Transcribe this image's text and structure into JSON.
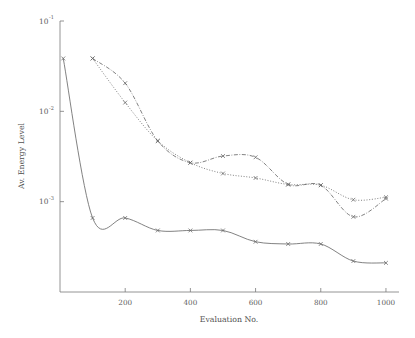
{
  "chart_data": {
    "type": "line",
    "title": "",
    "xlabel": "Evaluation No.",
    "ylabel": "Av. Energy Level",
    "yscale": "log",
    "xlim": [
      0,
      1040
    ],
    "ylim": [
      0.0001,
      0.1
    ],
    "grid": false,
    "legend": "none",
    "xticks": [
      200,
      400,
      600,
      800,
      1000
    ],
    "xtick_labels": [
      "200",
      "400",
      "600",
      "800",
      "1000"
    ],
    "yticks": [
      0.1,
      0.01,
      0.001
    ],
    "ytick_labels": [
      "10^-1",
      "10^-2",
      "10^-3"
    ],
    "ytick_bases": [
      "10",
      "10",
      "10"
    ],
    "ytick_exponents": [
      "-1",
      "-2",
      "-3"
    ],
    "series": [
      {
        "name": "series-solid-lower",
        "style": "solid",
        "marker": "x",
        "x": [
          10,
          100,
          200,
          300,
          400,
          500,
          600,
          700,
          800,
          900,
          1000
        ],
        "values": [
          0.0385,
          0.00066,
          0.00066,
          0.00048,
          0.00048,
          0.00048,
          0.00036,
          0.00034,
          0.00034,
          0.00022,
          0.00021
        ]
      },
      {
        "name": "series-dashdot-upper",
        "style": "dashdot",
        "marker": "x",
        "x": [
          100,
          200,
          300,
          400,
          500,
          600,
          700,
          800,
          900,
          1000
        ],
        "values": [
          0.0385,
          0.0205,
          0.0047,
          0.0027,
          0.0032,
          0.0031,
          0.00155,
          0.00152,
          0.00068,
          0.00108
        ]
      },
      {
        "name": "series-dotted-upper",
        "style": "dotted",
        "marker": "x",
        "x": [
          100,
          200,
          300,
          400,
          500,
          600,
          700,
          800,
          900,
          1000
        ],
        "values": [
          0.0385,
          0.0125,
          0.0047,
          0.0027,
          0.00205,
          0.00183,
          0.00155,
          0.00152,
          0.00105,
          0.00112
        ]
      }
    ]
  },
  "axes": {
    "x_axis_title": "Evaluation No.",
    "y_axis_title": "Av. Energy Level"
  }
}
